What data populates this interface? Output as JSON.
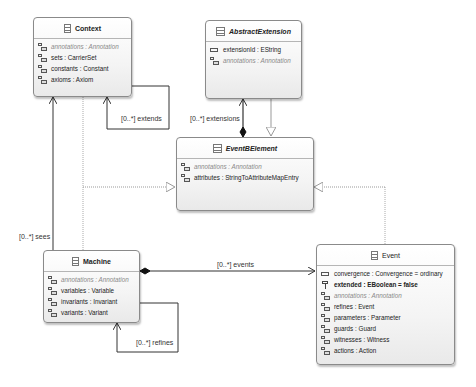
{
  "classes": {
    "context": {
      "name": "Context",
      "features": [
        {
          "text": "annotations : Annotation",
          "kind": "ref-derived"
        },
        {
          "text": "sets : CarrierSet",
          "kind": "ref"
        },
        {
          "text": "constants : Constant",
          "kind": "ref"
        },
        {
          "text": "axioms : Axiom",
          "kind": "ref"
        }
      ]
    },
    "abstract_extension": {
      "name": "AbstractExtension",
      "abstract": true,
      "features": [
        {
          "text": "extensionId : EString",
          "kind": "attribute"
        },
        {
          "text": "annotations : Annotation",
          "kind": "ref-derived"
        }
      ]
    },
    "eventb_element": {
      "name": "EventBElement",
      "abstract": true,
      "features": [
        {
          "text": "annotations : Annotation",
          "kind": "ref-derived"
        },
        {
          "text": "attributes : StringToAttributeMapEntry",
          "kind": "ref"
        }
      ]
    },
    "machine": {
      "name": "Machine",
      "features": [
        {
          "text": "annotations : Annotation",
          "kind": "ref-derived"
        },
        {
          "text": "variables : Variable",
          "kind": "ref"
        },
        {
          "text": "invariants : Invariant",
          "kind": "ref"
        },
        {
          "text": "variants : Variant",
          "kind": "ref"
        }
      ]
    },
    "event": {
      "name": "Event",
      "features": [
        {
          "text": "convergence : Convergence = ordinary",
          "kind": "attribute"
        },
        {
          "text": "extended : EBoolean = false",
          "kind": "bool-bold"
        },
        {
          "text": "annotations : Annotation",
          "kind": "ref-derived"
        },
        {
          "text": "refines : Event",
          "kind": "ref"
        },
        {
          "text": "parameters : Parameter",
          "kind": "ref"
        },
        {
          "text": "guards : Guard",
          "kind": "ref"
        },
        {
          "text": "witnesses : Witness",
          "kind": "ref"
        },
        {
          "text": "actions : Action",
          "kind": "ref"
        }
      ]
    }
  },
  "edges": {
    "extends": "[0..*] extends",
    "extensions": "[0..*] extensions",
    "sees": "[0..*] sees",
    "events": "[0..*] events",
    "refines": "[0..*] refines"
  },
  "colors": {
    "line": "#333333",
    "dotted": "#9a9a9a",
    "box_border": "#8a8a8a"
  }
}
